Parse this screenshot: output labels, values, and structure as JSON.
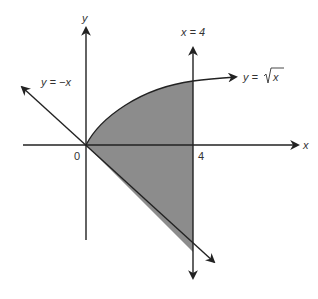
{
  "diagram": {
    "axes": {
      "x_label": "x",
      "y_label": "y",
      "origin_label": "0",
      "x_tick_label": "4"
    },
    "curves": [
      {
        "id": "sqrt",
        "label": "y = √x",
        "label_prefix": "y = ",
        "label_radicand": "x"
      },
      {
        "id": "neg",
        "label": "y = −x"
      },
      {
        "id": "vertical",
        "label": "x = 4"
      }
    ],
    "colors": {
      "shade": "#8c8c8c",
      "line": "#222222",
      "text": "#333333",
      "background": "#ffffff"
    }
  }
}
